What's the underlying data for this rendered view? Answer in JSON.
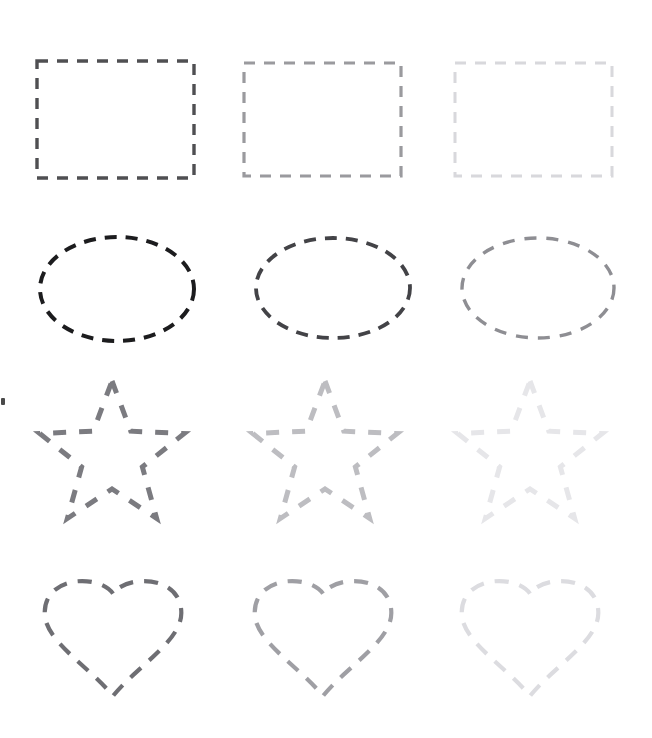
{
  "page": {
    "background_color": "#ffffff",
    "width": 652,
    "height": 738
  },
  "palette": {
    "rect_dark": "#4f4f52",
    "rect_mid": "#9a9a9e",
    "rect_light": "#d8d8dc",
    "ellipse_dark": "#1c1c1e",
    "ellipse_mid": "#434347",
    "ellipse_light": "#8e8e93",
    "star_dark": "#7b7b80",
    "star_mid": "#bdbdc1",
    "star_light": "#e6e6e9",
    "heart_dark": "#6e6e73",
    "heart_mid": "#9f9fa4",
    "heart_light": "#dcdce0"
  },
  "rows": [
    {
      "shape": "rectangle",
      "label": "Rectangle row",
      "columns": [
        {
          "level": "dark",
          "color": "#4f4f52",
          "stroke_width": 3.4,
          "dash": "11 9",
          "x": 37,
          "y": 61,
          "w": 157,
          "h": 117
        },
        {
          "level": "mid",
          "color": "#9a9a9e",
          "stroke_width": 3.2,
          "dash": "11 9",
          "x": 244,
          "y": 63,
          "w": 157,
          "h": 113
        },
        {
          "level": "light",
          "color": "#d8d8dc",
          "stroke_width": 3.0,
          "dash": "11 9",
          "x": 455,
          "y": 63,
          "w": 157,
          "h": 113
        }
      ]
    },
    {
      "shape": "ellipse",
      "label": "Ellipse row",
      "columns": [
        {
          "level": "dark",
          "color": "#1c1c1e",
          "stroke_width": 4.0,
          "dash": "12 9",
          "cx": 117,
          "cy": 289,
          "rx": 77,
          "ry": 52
        },
        {
          "level": "mid",
          "color": "#434347",
          "stroke_width": 3.8,
          "dash": "12 9",
          "cx": 333,
          "cy": 288,
          "rx": 77,
          "ry": 50
        },
        {
          "level": "light",
          "color": "#8e8e93",
          "stroke_width": 3.4,
          "dash": "12 10",
          "cx": 538,
          "cy": 288,
          "rx": 76,
          "ry": 50
        }
      ]
    },
    {
      "shape": "star",
      "label": "Five-pointed star row",
      "columns": [
        {
          "level": "dark",
          "color": "#7b7b80",
          "stroke_width": 5.0,
          "dash": "13 13",
          "cx": 112,
          "cy": 457,
          "r": 76
        },
        {
          "level": "mid",
          "color": "#bdbdc1",
          "stroke_width": 5.0,
          "dash": "13 13",
          "cx": 325,
          "cy": 457,
          "r": 76
        },
        {
          "level": "light",
          "color": "#e6e6e9",
          "stroke_width": 5.0,
          "dash": "13 13",
          "cx": 530,
          "cy": 457,
          "r": 76
        }
      ]
    },
    {
      "shape": "heart",
      "label": "Heart row",
      "columns": [
        {
          "level": "dark",
          "color": "#6e6e73",
          "stroke_width": 4.2,
          "dash": "14 11",
          "cx": 113,
          "cy": 634,
          "w": 140,
          "h": 124
        },
        {
          "level": "mid",
          "color": "#9f9fa4",
          "stroke_width": 4.2,
          "dash": "14 11",
          "cx": 323,
          "cy": 634,
          "w": 140,
          "h": 124
        },
        {
          "level": "light",
          "color": "#dcdce0",
          "stroke_width": 4.2,
          "dash": "14 11",
          "cx": 530,
          "cy": 634,
          "w": 140,
          "h": 124
        }
      ]
    }
  ],
  "artifacts": [
    {
      "name": "edge-speck",
      "x": 1,
      "y": 398,
      "w": 4,
      "h": 7,
      "color": "#4a4a4a"
    }
  ]
}
